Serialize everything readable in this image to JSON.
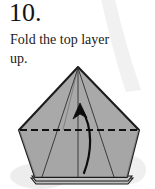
{
  "step": {
    "number": "10.",
    "instruction": "Fold the top layer up."
  },
  "colors": {
    "paper_fill": "#a9a9a9",
    "paper_fill_lower": "#a4a4a4",
    "outline": "#1c1c1c",
    "crease_line": "#3a3a3a",
    "fold_line": "#111111",
    "arrow": "#0d0d0d",
    "background": "#ffffff",
    "shadow": "#e9e9e9",
    "page_curl": "#f0f0f0"
  },
  "diagram": {
    "name": "origami-fold-step-diagram",
    "shape": {
      "name": "folded-paper-pentagon",
      "apex": [
        78,
        67
      ],
      "left_vertex": [
        19,
        130
      ],
      "right_vertex": [
        139,
        130
      ],
      "bottom_left": [
        35,
        177
      ],
      "bottom_right": [
        127,
        177
      ]
    },
    "fold_line": {
      "name": "valley-fold-dashed-line",
      "style": "dashed",
      "from": [
        19,
        130
      ],
      "to": [
        139,
        130
      ]
    },
    "arrow": {
      "name": "fold-direction-arrow",
      "direction": "up",
      "style": "curved",
      "tail": [
        83,
        172
      ],
      "head": [
        80,
        105
      ]
    },
    "creases": [
      {
        "name": "crease-center-vertical",
        "from": [
          78,
          67
        ],
        "to": [
          78,
          177
        ]
      },
      {
        "name": "crease-left-diagonal",
        "from": [
          78,
          67
        ],
        "to": [
          42,
          177
        ]
      },
      {
        "name": "crease-right-diagonal",
        "from": [
          78,
          67
        ],
        "to": [
          114,
          177
        ]
      }
    ],
    "layer_edges": [
      {
        "name": "bottom-layer-edge-1",
        "offset": 3
      },
      {
        "name": "bottom-layer-edge-2",
        "offset": 6
      }
    ]
  }
}
